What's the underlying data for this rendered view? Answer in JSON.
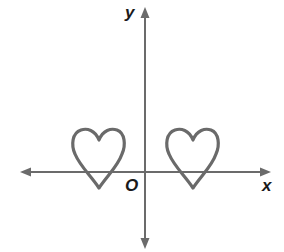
{
  "labels": {
    "y_axis": "y",
    "x_axis": "x",
    "origin": "O"
  },
  "colors": {
    "axis": "#6b6b6b",
    "heart": "#6a6a6a",
    "text": "#1a1a1a",
    "background": "#ffffff"
  },
  "figures": [
    {
      "name": "heart-left",
      "center_x": 99,
      "tip_y": 188
    },
    {
      "name": "heart-right",
      "center_x": 193,
      "tip_y": 188
    }
  ]
}
